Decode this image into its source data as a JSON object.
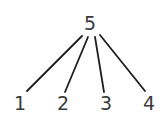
{
  "diagram": {
    "type": "tree",
    "root": {
      "label": "5"
    },
    "children": [
      {
        "label": "1"
      },
      {
        "label": "2"
      },
      {
        "label": "3"
      },
      {
        "label": "4"
      }
    ],
    "edges": [
      {
        "from": "5",
        "to": "1"
      },
      {
        "from": "5",
        "to": "2"
      },
      {
        "from": "5",
        "to": "3"
      },
      {
        "from": "5",
        "to": "4"
      }
    ]
  }
}
